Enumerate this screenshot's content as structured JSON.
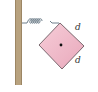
{
  "diagram": {
    "type": "physics",
    "elements": {
      "wall": {
        "color": "#b09a78",
        "edge_color": "#8c7858"
      },
      "spring": {
        "color": "#6a7a86",
        "coils": 6
      },
      "block": {
        "shape": "square rotated 45°",
        "fill": "#f0bccb",
        "stroke": "#5a4a50",
        "center_marker": "dot"
      },
      "labels": {
        "side_upper": "d",
        "side_lower": "d"
      }
    }
  }
}
